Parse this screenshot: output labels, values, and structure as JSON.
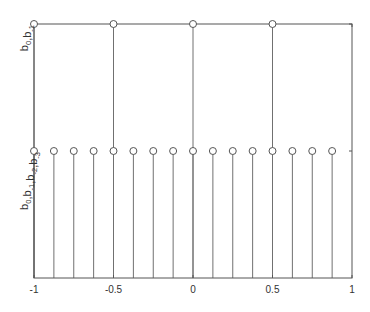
{
  "chart_data": {
    "type": "stem",
    "title": "",
    "xlabel": "",
    "ylabel": "",
    "xlim": [
      -1,
      1
    ],
    "ylim": [
      0,
      2
    ],
    "grid": false,
    "legend": "none",
    "xticks": [
      {
        "value": -1,
        "label": "-1"
      },
      {
        "value": -0.5,
        "label": "-0.5"
      },
      {
        "value": 0,
        "label": "0"
      },
      {
        "value": 0.5,
        "label": "0.5"
      },
      {
        "value": 1,
        "label": "1"
      }
    ],
    "yticks": [
      {
        "value": 1,
        "label_parts": [
          [
            "b",
            "0"
          ],
          [
            ",",
            ""
          ],
          [
            "b",
            "-1"
          ],
          [
            ",",
            ""
          ],
          [
            "b",
            "-2"
          ],
          [
            ",",
            ""
          ],
          [
            "b",
            "-3"
          ]
        ],
        "label": "b0,b-1,b-2,b-3"
      },
      {
        "value": 2,
        "label_parts": [
          [
            "b",
            "0"
          ],
          [
            ",",
            ""
          ],
          [
            "b",
            "-1"
          ]
        ],
        "label": "b0,b-1"
      }
    ],
    "series": [
      {
        "name": "level-2",
        "x": [
          -1,
          -0.5,
          0,
          0.5
        ],
        "y": [
          2,
          2,
          2,
          2
        ]
      },
      {
        "name": "level-1",
        "x": [
          -1,
          -0.875,
          -0.75,
          -0.625,
          -0.5,
          -0.375,
          -0.25,
          -0.125,
          0,
          0.125,
          0.25,
          0.375,
          0.5,
          0.625,
          0.75,
          0.875
        ],
        "y": [
          1,
          1,
          1,
          1,
          1,
          1,
          1,
          1,
          1,
          1,
          1,
          1,
          1,
          1,
          1,
          1
        ]
      }
    ]
  }
}
